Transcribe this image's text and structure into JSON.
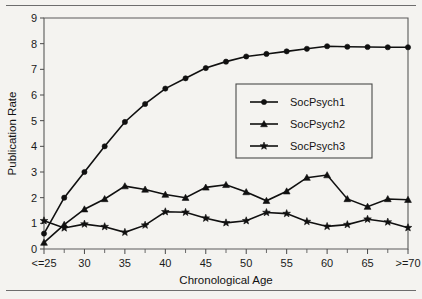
{
  "chart_data": {
    "type": "line",
    "title": "",
    "xlabel": "Chronological Age",
    "ylabel": "Publication Rate",
    "xlim": [
      25,
      70
    ],
    "ylim": [
      0,
      9
    ],
    "grid": false,
    "legend_position": "upper-right",
    "x": [
      25,
      27.5,
      30,
      32.5,
      35,
      37.5,
      40,
      42.5,
      45,
      47.5,
      50,
      52.5,
      55,
      57.5,
      60,
      62.5,
      65,
      67.5,
      70
    ],
    "xtick_labels": [
      "<=25",
      "30",
      "35",
      "40",
      "45",
      "50",
      "55",
      "60",
      "65",
      ">=70"
    ],
    "xtick_values": [
      25,
      30,
      35,
      40,
      45,
      50,
      55,
      60,
      65,
      70
    ],
    "ytick_labels": [
      "0",
      "1",
      "2",
      "3",
      "4",
      "5",
      "6",
      "7",
      "8",
      "9"
    ],
    "ytick_values": [
      0,
      1,
      2,
      3,
      4,
      5,
      6,
      7,
      8,
      9
    ],
    "series": [
      {
        "name": "SocPsych1",
        "marker": "circle",
        "values": [
          0.6,
          2.0,
          3.0,
          4.0,
          4.95,
          5.65,
          6.25,
          6.65,
          7.05,
          7.3,
          7.5,
          7.6,
          7.7,
          7.8,
          7.9,
          7.88,
          7.87,
          7.86,
          7.86
        ]
      },
      {
        "name": "SocPsych2",
        "marker": "triangle",
        "values": [
          0.25,
          0.95,
          1.55,
          1.95,
          2.45,
          2.32,
          2.12,
          2.0,
          2.4,
          2.5,
          2.22,
          1.88,
          2.25,
          2.78,
          2.88,
          1.95,
          1.65,
          1.95,
          1.92
        ]
      },
      {
        "name": "SocPsych3",
        "marker": "star",
        "values": [
          1.1,
          0.82,
          0.97,
          0.87,
          0.65,
          0.93,
          1.45,
          1.43,
          1.2,
          1.02,
          1.1,
          1.42,
          1.38,
          1.07,
          0.88,
          0.95,
          1.16,
          1.05,
          0.83
        ]
      }
    ],
    "colors": {
      "ink": "#101010",
      "axis": "#5a5a5a",
      "background": "#f4f3f0"
    }
  },
  "legend": {
    "entries": [
      {
        "label": "SocPsych1"
      },
      {
        "label": "SocPsych2"
      },
      {
        "label": "SocPsych3"
      }
    ]
  }
}
